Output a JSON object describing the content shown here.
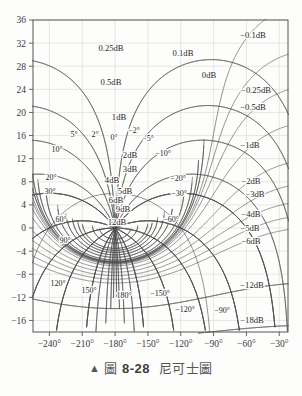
{
  "caption": {
    "marker": "▲",
    "label_cjk": "圖",
    "number": "8-28",
    "title_cjk": "尼可士圖"
  },
  "chart_data": {
    "type": "line",
    "title": "",
    "subtitle": "",
    "xlabel": "",
    "ylabel": "",
    "grid": true,
    "legend": "none",
    "xlim": [
      -255,
      -22
    ],
    "ylim": [
      -18,
      36
    ],
    "x_ticks": [
      "−240°",
      "−210°",
      "−180°",
      "−150°",
      "−120°",
      "−90°",
      "−60°",
      "−30°"
    ],
    "x_tick_values": [
      -240,
      -210,
      -180,
      -150,
      -120,
      -90,
      -60,
      -30
    ],
    "y_ticks": [
      "36",
      "32",
      "28",
      "24",
      "20",
      "16",
      "12",
      "8",
      "4",
      "0",
      "−4",
      "−8",
      "−12",
      "−16"
    ],
    "y_tick_values": [
      36,
      32,
      28,
      24,
      20,
      16,
      12,
      8,
      4,
      0,
      -4,
      -8,
      -12,
      -16
    ],
    "magnitude_contours_db": [
      {
        "label": "0.25dB",
        "value": 0.25
      },
      {
        "label": "0.5dB",
        "value": 0.5
      },
      {
        "label": "1dB",
        "value": 1
      },
      {
        "label": "0.1dB",
        "value": 0.1
      },
      {
        "label": "0dB",
        "value": 0
      },
      {
        "label": "2dB",
        "value": 2
      },
      {
        "label": "3dB",
        "value": 3
      },
      {
        "label": "4dB",
        "value": 4
      },
      {
        "label": "5dB",
        "value": 5
      },
      {
        "label": "6dB",
        "value": 6
      },
      {
        "label": "9dB",
        "value": 9
      },
      {
        "label": "12dB",
        "value": 12
      },
      {
        "label": "−0.1dB",
        "value": -0.1
      },
      {
        "label": "−0.25dB",
        "value": -0.25
      },
      {
        "label": "−0.5dB",
        "value": -0.5
      },
      {
        "label": "−1dB",
        "value": -1
      },
      {
        "label": "−2dB",
        "value": -2
      },
      {
        "label": "−3dB",
        "value": -3
      },
      {
        "label": "−4dB",
        "value": -4
      },
      {
        "label": "−5dB",
        "value": -5
      },
      {
        "label": "−6dB",
        "value": -6
      },
      {
        "label": "−12dB",
        "value": -12
      },
      {
        "label": "−18dB",
        "value": -18
      }
    ],
    "phase_contours_deg": [
      {
        "label": "5°",
        "value": 5
      },
      {
        "label": "2°",
        "value": 2
      },
      {
        "label": "0°",
        "value": 0
      },
      {
        "label": "−2°",
        "value": -2
      },
      {
        "label": "−5°",
        "value": -5
      },
      {
        "label": "10°",
        "value": 10
      },
      {
        "label": "−10°",
        "value": -10
      },
      {
        "label": "20°",
        "value": 20
      },
      {
        "label": "−20°",
        "value": -20
      },
      {
        "label": "30°",
        "value": 30
      },
      {
        "label": "−30°",
        "value": -30
      },
      {
        "label": "60°",
        "value": 60
      },
      {
        "label": "−60°",
        "value": -60
      },
      {
        "label": "90°",
        "value": 90
      },
      {
        "label": "−90°",
        "value": -90
      },
      {
        "label": "120°",
        "value": 120
      },
      {
        "label": "−120°",
        "value": -120
      },
      {
        "label": "150°",
        "value": 150
      },
      {
        "label": "−150°",
        "value": -150
      },
      {
        "label": "180°",
        "value": 180
      }
    ],
    "mag_labels": [
      {
        "text": "0.25dB",
        "x": 111,
        "y": 51,
        "size": 8.6
      },
      {
        "text": "0.5dB",
        "x": 111,
        "y": 85,
        "size": 8.6
      },
      {
        "text": "1dB",
        "x": 119,
        "y": 120,
        "size": 8.6
      },
      {
        "text": "0.1dB",
        "x": 183,
        "y": 56,
        "size": 8.6
      },
      {
        "text": "0dB",
        "x": 209,
        "y": 78,
        "size": 8.6
      },
      {
        "text": "2dB",
        "x": 130,
        "y": 158,
        "size": 8.6
      },
      {
        "text": "3dB",
        "x": 130,
        "y": 172,
        "size": 8.6
      },
      {
        "text": "4dB",
        "x": 112,
        "y": 183,
        "size": 8.6
      },
      {
        "text": "5dB",
        "x": 125,
        "y": 194,
        "size": 8.6
      },
      {
        "text": "6dB",
        "x": 116,
        "y": 203,
        "size": 8.6
      },
      {
        "text": "9dB",
        "x": 123,
        "y": 212,
        "size": 8.6
      },
      {
        "text": "12dB",
        "x": 117,
        "y": 225,
        "size": 8.6
      },
      {
        "text": "−0.1dB",
        "x": 253,
        "y": 38,
        "size": 8.6
      },
      {
        "text": "−0.25dB",
        "x": 256,
        "y": 93,
        "size": 8.6
      },
      {
        "text": "−0.5dB",
        "x": 253,
        "y": 110,
        "size": 8.6
      },
      {
        "text": "−1dB",
        "x": 250,
        "y": 148,
        "size": 8.6
      },
      {
        "text": "−2dB",
        "x": 251,
        "y": 184,
        "size": 8.6
      },
      {
        "text": "−3dB",
        "x": 255,
        "y": 197,
        "size": 8.6
      },
      {
        "text": "−4dB",
        "x": 251,
        "y": 217,
        "size": 8.6
      },
      {
        "text": "−5dB",
        "x": 250,
        "y": 231,
        "size": 8.6
      },
      {
        "text": "−6dB",
        "x": 251,
        "y": 244,
        "size": 8.6
      },
      {
        "text": "−12dB",
        "x": 252,
        "y": 288,
        "size": 8.6
      },
      {
        "text": "−18dB",
        "x": 252,
        "y": 323,
        "size": 8.6
      }
    ],
    "phase_labels": [
      {
        "text": "5°",
        "x": 74,
        "y": 137,
        "size": 8
      },
      {
        "text": "2°",
        "x": 95,
        "y": 137,
        "size": 8
      },
      {
        "text": "0°",
        "x": 114,
        "y": 140,
        "size": 8
      },
      {
        "text": "−2°",
        "x": 134,
        "y": 133,
        "size": 8
      },
      {
        "text": "−5°",
        "x": 148,
        "y": 141,
        "size": 8
      },
      {
        "text": "10°",
        "x": 57,
        "y": 152,
        "size": 8
      },
      {
        "text": "−10°",
        "x": 163,
        "y": 156,
        "size": 8
      },
      {
        "text": "20°",
        "x": 51,
        "y": 180,
        "size": 8
      },
      {
        "text": "−20°",
        "x": 178,
        "y": 181,
        "size": 8
      },
      {
        "text": "30°",
        "x": 50,
        "y": 194,
        "size": 8
      },
      {
        "text": "−30°",
        "x": 179,
        "y": 196,
        "size": 8
      },
      {
        "text": "60°",
        "x": 61,
        "y": 222,
        "size": 8
      },
      {
        "text": "−60°",
        "x": 171,
        "y": 222,
        "size": 8
      },
      {
        "text": "90°",
        "x": 65,
        "y": 243,
        "size": 8
      },
      {
        "text": "120°",
        "x": 58,
        "y": 286,
        "size": 8
      },
      {
        "text": "150°",
        "x": 89,
        "y": 293,
        "size": 8
      },
      {
        "text": "180°",
        "x": 124,
        "y": 298,
        "size": 8
      },
      {
        "text": "−150°",
        "x": 160,
        "y": 296,
        "size": 8
      },
      {
        "text": "−120°",
        "x": 185,
        "y": 312,
        "size": 8
      },
      {
        "text": "−90°",
        "x": 222,
        "y": 313,
        "size": 8
      }
    ]
  }
}
